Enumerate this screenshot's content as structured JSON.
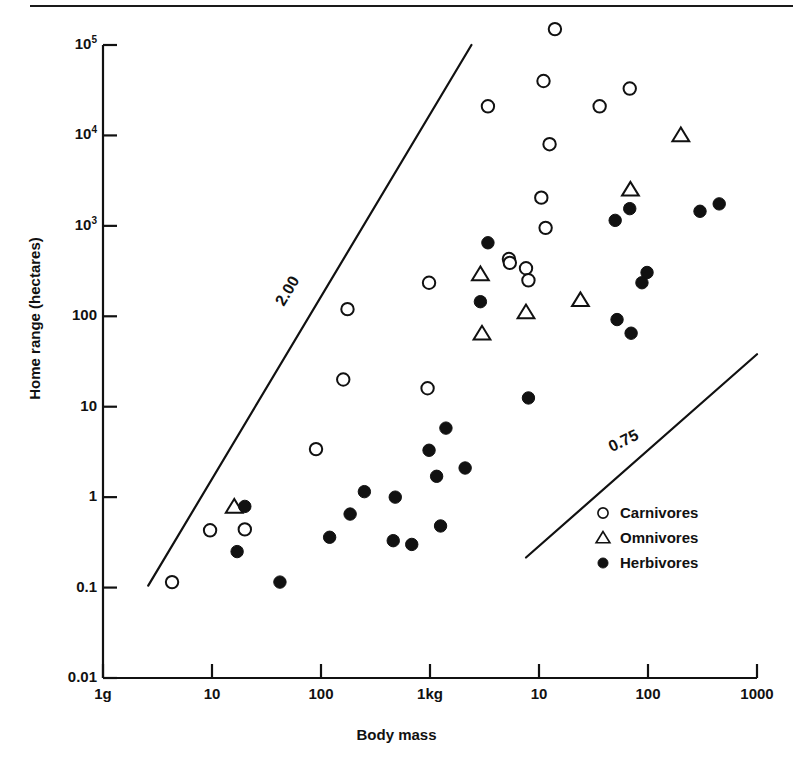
{
  "figure": {
    "has_top_rule": true,
    "background_color": "#ffffff",
    "ink_color": "#111111"
  },
  "chart_data": {
    "type": "scatter",
    "title": "",
    "xlabel": "Body mass",
    "ylabel": "Home range (hectares)",
    "grid": false,
    "legend_position": "inside-bottom-right",
    "x_scale": "log",
    "y_scale": "log",
    "xlim": [
      1,
      1000000
    ],
    "ylim": [
      0.01,
      100000
    ],
    "x_tick_labels": [
      "1g",
      "10",
      "100",
      "1kg",
      "10",
      "100",
      "1000"
    ],
    "x_tick_values": [
      1,
      10,
      100,
      1000,
      10000,
      100000,
      1000000
    ],
    "y_tick_labels": [
      "10^5",
      "10^4",
      "10^3",
      "100",
      "10",
      "1",
      "0.1",
      "0.01"
    ],
    "y_tick_values": [
      100000,
      10000,
      1000,
      100,
      10,
      1,
      0.1,
      0.01
    ],
    "annotations": [
      {
        "text": "2.00",
        "meaning": "reference slope 2.00",
        "rotation_deg": -59
      },
      {
        "text": "0.75",
        "meaning": "reference slope 0.75",
        "rotation_deg": -26
      }
    ],
    "reference_lines": [
      {
        "label": "2.00",
        "slope": 2.0,
        "x_start_g": 2.6,
        "y_start_ha": 0.105,
        "x_end_g": 2400,
        "y_end_ha": 100000
      },
      {
        "label": "0.75",
        "slope": 0.75,
        "x_start_g": 7600,
        "y_start_ha": 0.215,
        "x_end_g": 1000000,
        "y_end_ha": 38
      }
    ],
    "series": [
      {
        "name": "Carnivores",
        "marker": "open-circle",
        "points": [
          {
            "x_g": 4.3,
            "y_ha": 0.115
          },
          {
            "x_g": 9.6,
            "y_ha": 0.43
          },
          {
            "x_g": 20,
            "y_ha": 0.44
          },
          {
            "x_g": 90,
            "y_ha": 3.4
          },
          {
            "x_g": 160,
            "y_ha": 20
          },
          {
            "x_g": 175,
            "y_ha": 120
          },
          {
            "x_g": 950,
            "y_ha": 16
          },
          {
            "x_g": 980,
            "y_ha": 235
          },
          {
            "x_g": 3400,
            "y_ha": 21000
          },
          {
            "x_g": 5300,
            "y_ha": 430
          },
          {
            "x_g": 5400,
            "y_ha": 390
          },
          {
            "x_g": 7600,
            "y_ha": 340
          },
          {
            "x_g": 8000,
            "y_ha": 250
          },
          {
            "x_g": 10500,
            "y_ha": 2050
          },
          {
            "x_g": 11000,
            "y_ha": 40000
          },
          {
            "x_g": 11500,
            "y_ha": 950
          },
          {
            "x_g": 12500,
            "y_ha": 8000
          },
          {
            "x_g": 14000,
            "y_ha": 150000
          },
          {
            "x_g": 36000,
            "y_ha": 21000
          },
          {
            "x_g": 68000,
            "y_ha": 33000
          }
        ]
      },
      {
        "name": "Omnivores",
        "marker": "open-triangle",
        "points": [
          {
            "x_g": 16,
            "y_ha": 0.78
          },
          {
            "x_g": 2900,
            "y_ha": 290
          },
          {
            "x_g": 3000,
            "y_ha": 64
          },
          {
            "x_g": 7600,
            "y_ha": 110
          },
          {
            "x_g": 24000,
            "y_ha": 150
          },
          {
            "x_g": 69000,
            "y_ha": 2500
          },
          {
            "x_g": 200000,
            "y_ha": 10000
          }
        ]
      },
      {
        "name": "Herbivores",
        "marker": "filled-circle",
        "points": [
          {
            "x_g": 17,
            "y_ha": 0.25
          },
          {
            "x_g": 20,
            "y_ha": 0.79
          },
          {
            "x_g": 42,
            "y_ha": 0.115
          },
          {
            "x_g": 120,
            "y_ha": 0.36
          },
          {
            "x_g": 185,
            "y_ha": 0.65
          },
          {
            "x_g": 250,
            "y_ha": 1.15
          },
          {
            "x_g": 460,
            "y_ha": 0.33
          },
          {
            "x_g": 480,
            "y_ha": 1.0
          },
          {
            "x_g": 680,
            "y_ha": 0.3
          },
          {
            "x_g": 980,
            "y_ha": 3.3
          },
          {
            "x_g": 1150,
            "y_ha": 1.7
          },
          {
            "x_g": 1250,
            "y_ha": 0.48
          },
          {
            "x_g": 1400,
            "y_ha": 5.8
          },
          {
            "x_g": 2100,
            "y_ha": 2.1
          },
          {
            "x_g": 2900,
            "y_ha": 145
          },
          {
            "x_g": 3400,
            "y_ha": 650
          },
          {
            "x_g": 8000,
            "y_ha": 12.5
          },
          {
            "x_g": 50000,
            "y_ha": 1150
          },
          {
            "x_g": 52000,
            "y_ha": 92
          },
          {
            "x_g": 68000,
            "y_ha": 1550
          },
          {
            "x_g": 70000,
            "y_ha": 65
          },
          {
            "x_g": 88000,
            "y_ha": 235
          },
          {
            "x_g": 98000,
            "y_ha": 305
          },
          {
            "x_g": 300000,
            "y_ha": 1450
          },
          {
            "x_g": 450000,
            "y_ha": 1750
          }
        ]
      }
    ]
  },
  "axes": {
    "x_title": "Body mass",
    "y_title": "Home range (hectares)",
    "y_ticks": [
      {
        "base": "10",
        "exp": "5"
      },
      {
        "base": "10",
        "exp": "4"
      },
      {
        "base": "10",
        "exp": "3"
      },
      {
        "base": "100",
        "exp": ""
      },
      {
        "base": "10",
        "exp": ""
      },
      {
        "base": "1",
        "exp": ""
      },
      {
        "base": "0.1",
        "exp": ""
      },
      {
        "base": "0.01",
        "exp": ""
      }
    ],
    "x_ticks": [
      "1g",
      "10",
      "100",
      "1kg",
      "10",
      "100",
      "1000"
    ]
  },
  "slope_labels": {
    "steep": "2.00",
    "shallow": "0.75"
  },
  "legend": {
    "items": [
      {
        "label": "Carnivores",
        "marker": "open-circle"
      },
      {
        "label": "Omnivores",
        "marker": "open-triangle"
      },
      {
        "label": "Herbivores",
        "marker": "filled-circle"
      }
    ]
  }
}
